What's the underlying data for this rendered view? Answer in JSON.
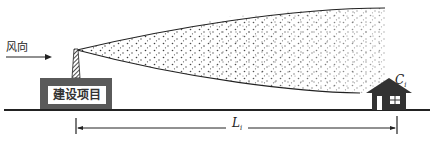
{
  "diagram": {
    "wind_direction_label": "风向",
    "building_label": "建设项目",
    "receptor_label": "C",
    "receptor_subscript": "i",
    "distance_label": "L",
    "distance_subscript": "i"
  },
  "colors": {
    "ink": "#222222",
    "building_fill": "#5a5a5a",
    "plume_dots": "#333333"
  }
}
